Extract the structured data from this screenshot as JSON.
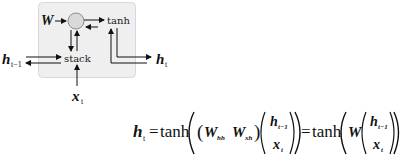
{
  "diagram": {
    "nodes": {
      "weight": "W",
      "stack": "stack",
      "activation": "tanh",
      "prev_hidden": "h",
      "prev_hidden_sub": "t−1",
      "input": "x",
      "input_sub": "t",
      "output": "h",
      "output_sub": "t"
    },
    "colors": {
      "box_fill": "#efefef",
      "box_border": "#d8d8d8",
      "circle_fill": "#d9d9d9",
      "stroke": "#111111"
    }
  },
  "equation": {
    "lhs": "h",
    "lhs_sub": "t",
    "eq1": "=",
    "fn1": "tanh",
    "w_hh": "W",
    "w_hh_sub": "hh",
    "w_xh": "W",
    "w_xh_sub": "xh",
    "vec_top": "h",
    "vec_top_sub": "t−1",
    "vec_bottom": "x",
    "vec_bottom_sub": "t",
    "eq2": "=",
    "fn2": "tanh",
    "w": "W"
  }
}
